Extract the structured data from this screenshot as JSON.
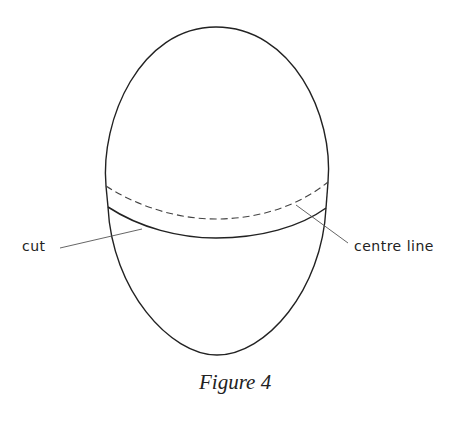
{
  "figure": {
    "caption": "Figure 4",
    "labels": {
      "cut": "cut",
      "centre_line": "centre line"
    },
    "line_color": "#222222"
  }
}
